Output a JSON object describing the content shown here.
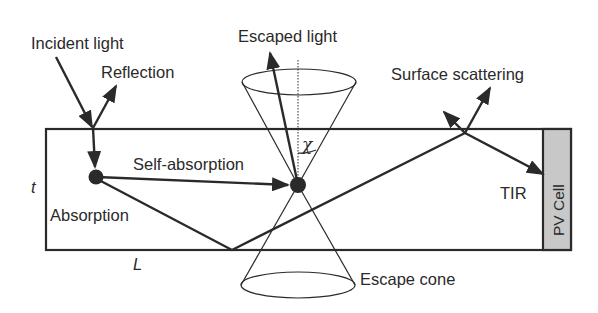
{
  "diagram": {
    "labels": {
      "incident_light": "Incident light",
      "reflection": "Reflection",
      "escaped_light": "Escaped light",
      "surface_scattering": "Surface scattering",
      "self_absorption": "Self-absorption",
      "absorption": "Absorption",
      "tir": "TIR",
      "pv_cell": "PV Cell",
      "escape_cone": "Escape cone",
      "thickness": "t",
      "length": "L",
      "angle": "χ"
    },
    "colors": {
      "line": "#2a2a2a",
      "pv_fill": "#c8c8c8",
      "background": "#ffffff"
    }
  }
}
